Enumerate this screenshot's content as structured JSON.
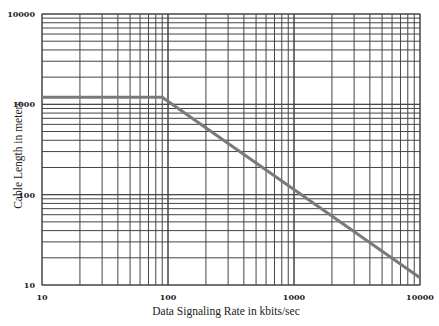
{
  "chart_data": {
    "type": "line",
    "title": "",
    "xlabel": "Data Signaling Rate in kbits/sec",
    "ylabel": "Cable Length in meters",
    "xscale": "log",
    "yscale": "log",
    "xlim": [
      10,
      10000
    ],
    "ylim": [
      10,
      10000
    ],
    "x_ticks": [
      "10",
      "100",
      "1000",
      "10000"
    ],
    "y_ticks": [
      "10",
      "100",
      "1000",
      "10000"
    ],
    "grid": true,
    "legend": null,
    "series": [
      {
        "name": "Max cable length",
        "x": [
          10,
          90,
          10000
        ],
        "y": [
          1200,
          1200,
          12
        ]
      }
    ],
    "colors": {
      "line": "#7a7a7a",
      "grid": "#444444",
      "frame": "#444444"
    }
  }
}
